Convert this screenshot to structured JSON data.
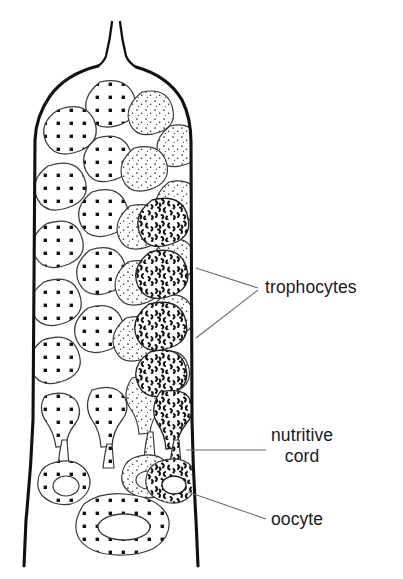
{
  "figure": {
    "background_color": "#ffffff",
    "ink_color": "#1a1a1a",
    "outline_color": "#111111",
    "cell_line_color": "#3a3a3a",
    "leader_color": "#6b6b6b"
  },
  "labels": {
    "trophocytes": "trophocytes",
    "nutritive_cord_line1": "nutritive",
    "nutritive_cord_line2": "cord",
    "oocyte": "oocyte"
  },
  "structures": {
    "terminal_filament": "terminal-filament",
    "ovariole_wall": "ovariole-wall",
    "tropharium": "tropharium",
    "large_oocyte": "large-oocyte"
  },
  "cell_patterns": {
    "bold_dots": "coarse-grid-dots",
    "fine_stipple": "fine-stipple",
    "squiggle": "dense-squiggle"
  },
  "cell_counts": {
    "bold_dot_cells": 10,
    "fine_stipple_cells": 13,
    "squiggle_cells": 5,
    "oocytes": 4,
    "nutritive_cords": 3
  }
}
